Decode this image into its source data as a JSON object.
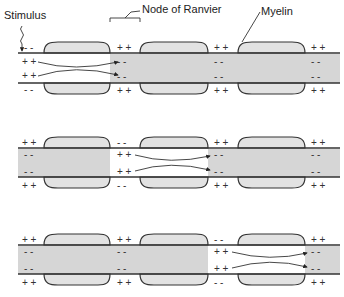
{
  "labels": {
    "stimulus": "Stimulus",
    "node": "Node of Ranvier",
    "myelin": "Myelin"
  },
  "colors": {
    "myelin_fill": "#e2e2e2",
    "depolarized_fill": "#d6d6d6",
    "axon_outline": "#333333",
    "background": "#ffffff"
  },
  "panels": [
    {
      "stage": 1,
      "shaded_ranges": [
        [
          110,
          340
        ]
      ],
      "node_charges_top_outside": [
        "- -",
        "+ +",
        "+ +",
        "+ +"
      ],
      "node_charges_top_inside": [
        "+ +",
        "- -",
        "- -",
        "- -"
      ],
      "node_charges_bottom_inside": [
        "+ +",
        "- -",
        "- -",
        "- -"
      ],
      "node_charges_bottom_outside": [
        "- -",
        "+ +",
        "+ +",
        "+ +"
      ],
      "current_arrows": "from node 1 to node 2"
    },
    {
      "stage": 2,
      "shaded_ranges": [
        [
          18,
          110
        ],
        [
          208,
          340
        ]
      ],
      "node_charges_top_outside": [
        "+ +",
        "- -",
        "+ +",
        "+ +"
      ],
      "node_charges_top_inside": [
        "- -",
        "+ +",
        "- -",
        "- -"
      ],
      "node_charges_bottom_inside": [
        "- -",
        "+ +",
        "- -",
        "- -"
      ],
      "node_charges_bottom_outside": [
        "+ +",
        "- -",
        "+ +",
        "+ +"
      ],
      "current_arrows": "from node 2 to node 3"
    },
    {
      "stage": 3,
      "shaded_ranges": [
        [
          18,
          208
        ],
        [
          305,
          340
        ]
      ],
      "node_charges_top_outside": [
        "+ +",
        "+ +",
        "- -",
        "+ +"
      ],
      "node_charges_top_inside": [
        "- -",
        "- -",
        "+ +",
        "- -"
      ],
      "node_charges_bottom_inside": [
        "- -",
        "- -",
        "+ +",
        "- -"
      ],
      "node_charges_bottom_outside": [
        "+ +",
        "+ +",
        "- -",
        "+ +"
      ],
      "current_arrows": "from node 3 to node 4"
    }
  ]
}
